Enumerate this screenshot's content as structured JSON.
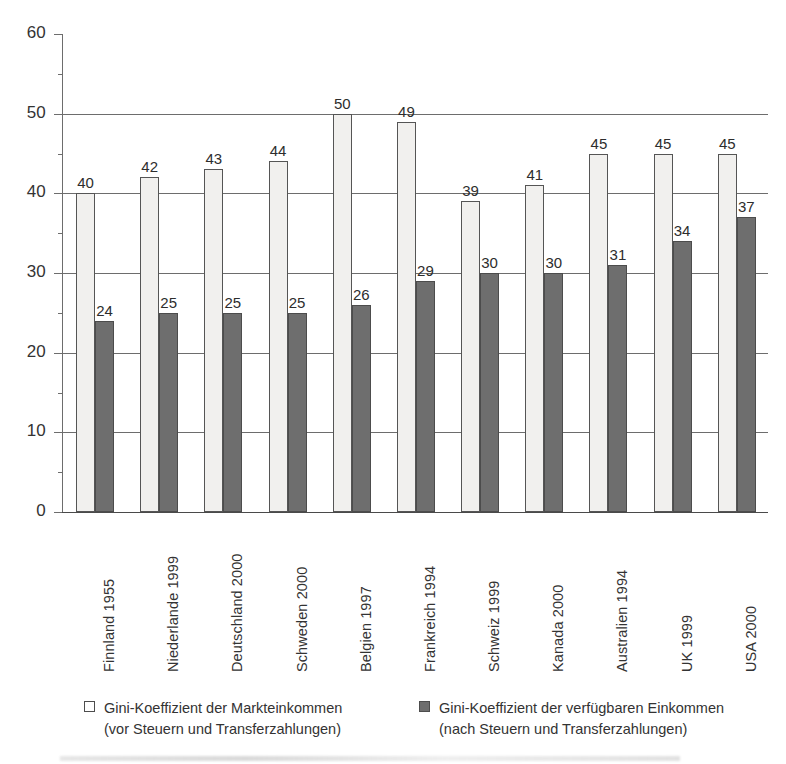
{
  "chart_data": {
    "type": "bar",
    "title": "",
    "xlabel": "",
    "ylabel": "",
    "ylim": [
      0,
      60
    ],
    "ytick_values": [
      0,
      10,
      20,
      30,
      40,
      50,
      60
    ],
    "ytick_labels": [
      "0",
      "10",
      "20",
      "30",
      "40",
      "50",
      "60"
    ],
    "minor_tick_step": 5,
    "grid": "horizontal-major",
    "legend_position": "bottom",
    "categories": [
      "Finnland 1955",
      "Niederlande 1999",
      "Deutschland 2000",
      "Schweden 2000",
      "Belgien 1997",
      "Frankreich 1994",
      "Schweiz 1999",
      "Kanada 2000",
      "Australien 1994",
      "UK 1999",
      "USA 2000"
    ],
    "series": [
      {
        "name": "Gini-Koeffizient der Markteinkommen",
        "name_line2": "(vor Steuern und Transferzahlungen)",
        "color": "#f1f0ee",
        "values": [
          40,
          42,
          43,
          44,
          50,
          49,
          39,
          41,
          45,
          45,
          45
        ],
        "value_labels": [
          "40",
          "42",
          "43",
          "44",
          "50",
          "49",
          "39",
          "41",
          "45",
          "45",
          "45"
        ]
      },
      {
        "name": "Gini-Koeffizient der verfügbaren Einkommen",
        "name_line2": "(nach Steuern und Transferzahlungen)",
        "color": "#6e6e6e",
        "values": [
          24,
          25,
          25,
          25,
          26,
          29,
          30,
          30,
          31,
          34,
          37
        ],
        "value_labels": [
          "24",
          "25",
          "25",
          "25",
          "26",
          "29",
          "30",
          "30",
          "31",
          "34",
          "37"
        ]
      }
    ]
  },
  "legend": {
    "entries": [
      {
        "swatch": "light",
        "line1": "Gini-Koeffizient der Markteinkommen",
        "line2": "(vor Steuern und Transferzahlungen)"
      },
      {
        "swatch": "dark",
        "line1": "Gini-Koeffizient der verfügbaren Einkommen",
        "line2": "(nach Steuern und Transferzahlungen)"
      }
    ]
  }
}
